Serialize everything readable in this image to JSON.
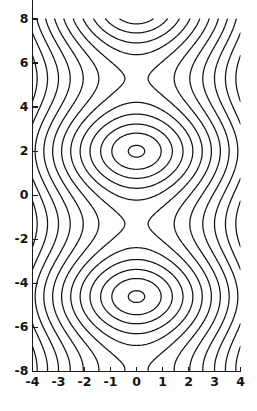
{
  "figure": {
    "kind": "contour-plot",
    "width": 257,
    "height": 411,
    "background_color": "#ffffff",
    "line_color": "#141414",
    "axis_color": "#1a1a1a"
  },
  "chart_data": {
    "type": "line",
    "subtype": "contour",
    "title": "",
    "subtitle": "",
    "xlabel": "",
    "ylabel": "",
    "xlim": [
      -4,
      4
    ],
    "ylim": [
      -8,
      8
    ],
    "grid": false,
    "legend": null,
    "x_ticks": [
      -4,
      -3,
      -2,
      -1,
      0,
      1,
      2,
      3,
      4
    ],
    "x_tick_labels": [
      "-4",
      "-3",
      "-2",
      "-1",
      "0",
      "1",
      "2",
      "3",
      "4"
    ],
    "y_ticks": [
      -8,
      -6,
      -4,
      -2,
      0,
      2,
      4,
      6,
      8
    ],
    "y_tick_labels": [
      "-8",
      "-6",
      "-4",
      "-2",
      "0",
      "2",
      "4",
      "6",
      "8"
    ],
    "y_top_label_clipped": true,
    "field": {
      "expression": "f(x,y) = x*x - 3.1*cos((y - 2.0) * 0.952)",
      "x_coefficient": 1.0,
      "cos_amplitude": 3.1,
      "y_period": 6.6,
      "y_phase_center": 2.0
    },
    "levels": [
      -3.0,
      -2.2,
      -1.2,
      0.1,
      1.6,
      3.3,
      5.2,
      7.3,
      9.6,
      12.1,
      14.8,
      17.7
    ],
    "closed_contour_centers": [
      {
        "x": 0,
        "y": 2.0,
        "rings": 3
      },
      {
        "x": 0,
        "y": -4.6,
        "rings": 3
      },
      {
        "x": 0,
        "y": 8.6,
        "rings": 3
      }
    ],
    "saddle_points": [
      {
        "x": 0,
        "y": -1.3
      },
      {
        "x": 0,
        "y": 5.3
      }
    ],
    "n_contour_levels": 12
  }
}
